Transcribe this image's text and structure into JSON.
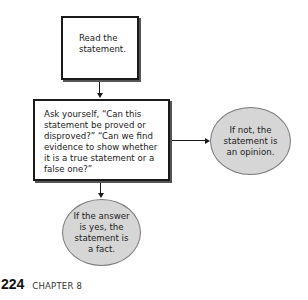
{
  "diagram": {
    "type": "flowchart",
    "nodes": [
      {
        "id": "read",
        "shape": "rectangle",
        "text": "Read the statement."
      },
      {
        "id": "ask",
        "shape": "rectangle",
        "text": "Ask yourself, “Can this statement be proved or disproved?” “Can we find evidence to show whether it is a true statement or a false one?”"
      },
      {
        "id": "opinion",
        "shape": "ellipse",
        "text": "If not, the statement is an opinion."
      },
      {
        "id": "fact",
        "shape": "ellipse",
        "text": "If the answer is yes, the statement is a fact."
      }
    ],
    "edges": [
      {
        "from": "read",
        "to": "ask"
      },
      {
        "from": "ask",
        "to": "opinion"
      },
      {
        "from": "ask",
        "to": "fact"
      }
    ]
  },
  "footer": {
    "page_number": "224",
    "chapter": "CHAPTER 8"
  },
  "colors": {
    "ellipse_fill": "#d6d6d6",
    "ellipse_border": "#7a7a7a",
    "box_border": "#1a1a1a"
  }
}
